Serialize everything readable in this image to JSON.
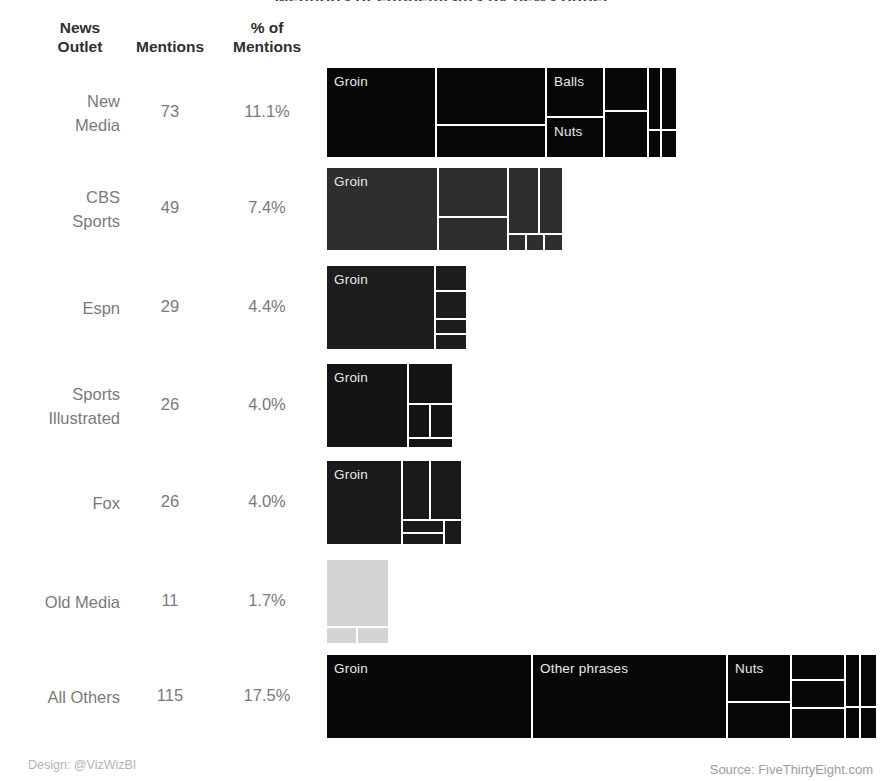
{
  "columns": {
    "outlet": {
      "line1": "News",
      "line2": "Outlet"
    },
    "mentions": {
      "line1": "",
      "line2": "Mentions"
    },
    "percent": {
      "line1": "% of",
      "line2": "Mentions"
    }
  },
  "footer": {
    "design": "Design: @VizWizBI",
    "source": "Source: FiveThirtyEight.com"
  },
  "colors": {
    "background": "#ffffff",
    "header_text": "#2f2f2f",
    "body_text": "#7a7a7a",
    "tile_gap": "#ffffff",
    "footer_text": "#b4b4b4"
  },
  "chart_data": {
    "type": "treemap",
    "title": "Mentions of euphemisms by news outlet",
    "categories": [
      "New Media",
      "CBS Sports",
      "Espn",
      "Sports Illustrated",
      "Fox",
      "Old Media",
      "All Others"
    ],
    "values": [
      73,
      49,
      29,
      26,
      26,
      11,
      115
    ],
    "percents": [
      "11.1%",
      "7.4%",
      "4.4%",
      "4.0%",
      "4.0%",
      "1.7%",
      "17.5%"
    ],
    "xlabel": "",
    "ylabel": "",
    "legend": "none",
    "grid": false,
    "rows": [
      {
        "outlet": {
          "line1": "New",
          "line2": "Media"
        },
        "mentions": "73",
        "percent": "11.1%",
        "color": "#070707",
        "width_px": 349,
        "tiles": [
          {
            "label": "Groin",
            "x": 0,
            "y": 0,
            "w": 108,
            "h": 89
          },
          {
            "label": "",
            "x": 110,
            "y": 0,
            "w": 108,
            "h": 56
          },
          {
            "label": "",
            "x": 110,
            "y": 58,
            "w": 108,
            "h": 31
          },
          {
            "label": "Balls",
            "x": 220,
            "y": 0,
            "w": 56,
            "h": 48
          },
          {
            "label": "Nuts",
            "x": 220,
            "y": 50,
            "w": 56,
            "h": 39
          },
          {
            "label": "",
            "x": 278,
            "y": 0,
            "w": 42,
            "h": 42
          },
          {
            "label": "",
            "x": 278,
            "y": 44,
            "w": 42,
            "h": 45
          },
          {
            "label": "",
            "x": 322,
            "y": 0,
            "w": 11,
            "h": 61
          },
          {
            "label": "",
            "x": 322,
            "y": 63,
            "w": 11,
            "h": 26
          },
          {
            "label": "",
            "x": 335,
            "y": 0,
            "w": 14,
            "h": 61
          },
          {
            "label": "",
            "x": 335,
            "y": 63,
            "w": 14,
            "h": 26
          }
        ]
      },
      {
        "outlet": {
          "line1": "CBS",
          "line2": "Sports"
        },
        "mentions": "49",
        "percent": "7.4%",
        "color": "#2e2e2e",
        "width_px": 235,
        "tiles": [
          {
            "label": "Groin",
            "x": 0,
            "y": 0,
            "w": 110,
            "h": 82
          },
          {
            "label": "",
            "x": 112,
            "y": 0,
            "w": 68,
            "h": 48
          },
          {
            "label": "",
            "x": 112,
            "y": 50,
            "w": 68,
            "h": 32
          },
          {
            "label": "",
            "x": 182,
            "y": 0,
            "w": 29,
            "h": 65
          },
          {
            "label": "",
            "x": 213,
            "y": 0,
            "w": 22,
            "h": 65
          },
          {
            "label": "",
            "x": 182,
            "y": 67,
            "w": 16,
            "h": 15
          },
          {
            "label": "",
            "x": 200,
            "y": 67,
            "w": 16,
            "h": 15
          },
          {
            "label": "",
            "x": 218,
            "y": 67,
            "w": 17,
            "h": 15
          }
        ]
      },
      {
        "outlet": {
          "line1": "Espn",
          "line2": ""
        },
        "mentions": "29",
        "percent": "4.4%",
        "color": "#1d1d1d",
        "width_px": 139,
        "tiles": [
          {
            "label": "Groin",
            "x": 0,
            "y": 0,
            "w": 107,
            "h": 83
          },
          {
            "label": "",
            "x": 109,
            "y": 0,
            "w": 30,
            "h": 24
          },
          {
            "label": "",
            "x": 109,
            "y": 26,
            "w": 30,
            "h": 26
          },
          {
            "label": "",
            "x": 109,
            "y": 54,
            "w": 30,
            "h": 13
          },
          {
            "label": "",
            "x": 109,
            "y": 69,
            "w": 30,
            "h": 14
          }
        ]
      },
      {
        "outlet": {
          "line1": "Sports",
          "line2": "Illustrated"
        },
        "mentions": "26",
        "percent": "4.0%",
        "color": "#141414",
        "width_px": 125,
        "tiles": [
          {
            "label": "Groin",
            "x": 0,
            "y": 0,
            "w": 80,
            "h": 83
          },
          {
            "label": "",
            "x": 82,
            "y": 0,
            "w": 43,
            "h": 39
          },
          {
            "label": "",
            "x": 82,
            "y": 41,
            "w": 20,
            "h": 32
          },
          {
            "label": "",
            "x": 104,
            "y": 41,
            "w": 21,
            "h": 32
          },
          {
            "label": "",
            "x": 82,
            "y": 75,
            "w": 43,
            "h": 8
          }
        ]
      },
      {
        "outlet": {
          "line1": "Fox",
          "line2": ""
        },
        "mentions": "26",
        "percent": "4.0%",
        "color": "#1a1a1a",
        "width_px": 134,
        "tiles": [
          {
            "label": "Groin",
            "x": 0,
            "y": 0,
            "w": 74,
            "h": 83
          },
          {
            "label": "",
            "x": 76,
            "y": 0,
            "w": 26,
            "h": 58
          },
          {
            "label": "",
            "x": 104,
            "y": 0,
            "w": 30,
            "h": 58
          },
          {
            "label": "",
            "x": 76,
            "y": 60,
            "w": 40,
            "h": 11
          },
          {
            "label": "",
            "x": 76,
            "y": 73,
            "w": 40,
            "h": 10
          },
          {
            "label": "",
            "x": 118,
            "y": 60,
            "w": 16,
            "h": 23
          }
        ]
      },
      {
        "outlet": {
          "line1": "Old Media",
          "line2": ""
        },
        "mentions": "11",
        "percent": "1.7%",
        "color": "#d4d4d4",
        "width_px": 61,
        "tiles": [
          {
            "label": "",
            "x": 0,
            "y": 0,
            "w": 61,
            "h": 66
          },
          {
            "label": "",
            "x": 0,
            "y": 68,
            "w": 29,
            "h": 15
          },
          {
            "label": "",
            "x": 31,
            "y": 68,
            "w": 30,
            "h": 15
          }
        ]
      },
      {
        "outlet": {
          "line1": "All Others",
          "line2": ""
        },
        "mentions": "115",
        "percent": "17.5%",
        "color": "#080808",
        "width_px": 549,
        "tiles": [
          {
            "label": "Groin",
            "x": 0,
            "y": 0,
            "w": 204,
            "h": 83
          },
          {
            "label": "Other phrases",
            "x": 206,
            "y": 0,
            "w": 193,
            "h": 83
          },
          {
            "label": "Nuts",
            "x": 401,
            "y": 0,
            "w": 62,
            "h": 46
          },
          {
            "label": "",
            "x": 401,
            "y": 48,
            "w": 62,
            "h": 35
          },
          {
            "label": "",
            "x": 465,
            "y": 0,
            "w": 52,
            "h": 24
          },
          {
            "label": "",
            "x": 465,
            "y": 26,
            "w": 52,
            "h": 26
          },
          {
            "label": "",
            "x": 465,
            "y": 54,
            "w": 52,
            "h": 29
          },
          {
            "label": "",
            "x": 519,
            "y": 0,
            "w": 13,
            "h": 51
          },
          {
            "label": "",
            "x": 519,
            "y": 53,
            "w": 13,
            "h": 30
          },
          {
            "label": "",
            "x": 534,
            "y": 0,
            "w": 15,
            "h": 51
          },
          {
            "label": "",
            "x": 534,
            "y": 53,
            "w": 15,
            "h": 30
          }
        ]
      }
    ],
    "row_geometry": [
      {
        "top": 68,
        "height": 89,
        "left": 327
      },
      {
        "top": 168,
        "height": 82,
        "left": 327
      },
      {
        "top": 266,
        "height": 83,
        "left": 327
      },
      {
        "top": 364,
        "height": 83,
        "left": 327
      },
      {
        "top": 461,
        "height": 83,
        "left": 327
      },
      {
        "top": 560,
        "height": 83,
        "left": 327
      },
      {
        "top": 655,
        "height": 83,
        "left": 327
      }
    ]
  }
}
